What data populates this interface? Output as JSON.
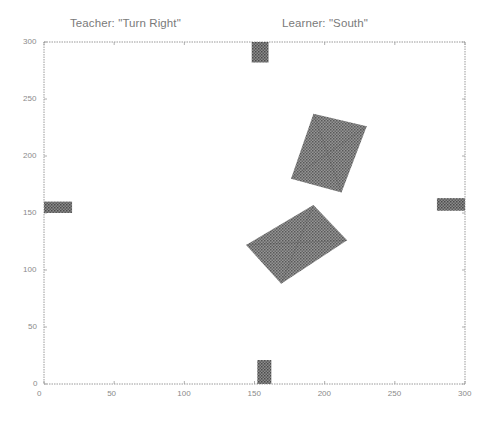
{
  "titles": {
    "left": "Teacher: \"Turn Right\"",
    "right": "Learner: \"South\""
  },
  "chart_data": {
    "type": "scatter",
    "xlabel": "",
    "ylabel": "",
    "xlim": [
      0,
      300
    ],
    "ylim": [
      0,
      300
    ],
    "grid": false,
    "x_ticks": [
      "0",
      "50",
      "100",
      "150",
      "200",
      "250",
      "300"
    ],
    "y_ticks": [
      "0",
      "50",
      "100",
      "150",
      "200",
      "250",
      "300"
    ],
    "shapes": [
      {
        "name": "top-marker",
        "kind": "rect",
        "x": [
          148,
          160
        ],
        "y": [
          282,
          300
        ]
      },
      {
        "name": "bottom-marker",
        "kind": "rect",
        "x": [
          152,
          162
        ],
        "y": [
          0,
          21
        ]
      },
      {
        "name": "left-marker",
        "kind": "rect",
        "x": [
          0,
          20
        ],
        "y": [
          150,
          160
        ]
      },
      {
        "name": "right-marker",
        "kind": "rect",
        "x": [
          280,
          300
        ],
        "y": [
          152,
          163
        ]
      },
      {
        "name": "upper-rotated-rectangle",
        "kind": "polygon",
        "points": [
          [
            192,
            237
          ],
          [
            230,
            226
          ],
          [
            212,
            168
          ],
          [
            176,
            180
          ]
        ]
      },
      {
        "name": "lower-rotated-rectangle",
        "kind": "polygon",
        "points": [
          [
            192,
            157
          ],
          [
            216,
            126
          ],
          [
            169,
            88
          ],
          [
            144,
            122
          ]
        ]
      }
    ]
  },
  "style": {
    "axis_color": "#9a9a9a",
    "shape_fill": "#6e6e6e",
    "text_color": "#7a7a7a"
  }
}
